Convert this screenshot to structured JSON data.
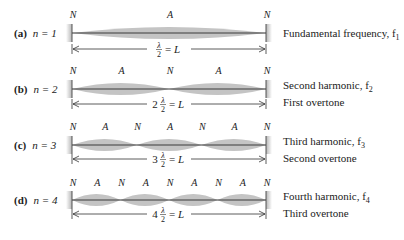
{
  "figure": {
    "colors": {
      "envelope": "#c4c4c4",
      "string": "#3a3a3a",
      "wall": "#bdbdbd",
      "text": "#222222"
    },
    "string_span": {
      "x_left": 72,
      "x_right": 266
    },
    "rows": [
      {
        "id": "a",
        "letter": "(a)",
        "n_label": "n = 1",
        "n": 1,
        "node_labels": [
          "N",
          "A",
          "N"
        ],
        "length_label": "λ/2 = L",
        "length_prefix": "",
        "caption_line1": "Fundamental frequency, f",
        "caption_sub1": "1",
        "caption_line2": ""
      },
      {
        "id": "b",
        "letter": "(b)",
        "n_label": "n = 2",
        "n": 2,
        "node_labels": [
          "N",
          "A",
          "N",
          "A",
          "N"
        ],
        "length_label": "2 λ/2 = L",
        "length_prefix": "2",
        "caption_line1": "Second harmonic, f",
        "caption_sub1": "2",
        "caption_line2": "First overtone"
      },
      {
        "id": "c",
        "letter": "(c)",
        "n_label": "n = 3",
        "n": 3,
        "node_labels": [
          "N",
          "A",
          "N",
          "A",
          "N",
          "A",
          "N"
        ],
        "length_label": "3 λ/2 = L",
        "length_prefix": "3",
        "caption_line1": "Third harmonic, f",
        "caption_sub1": "3",
        "caption_line2": "Second overtone"
      },
      {
        "id": "d",
        "letter": "(d)",
        "n_label": "n = 4",
        "n": 4,
        "node_labels": [
          "N",
          "A",
          "N",
          "A",
          "N",
          "A",
          "N",
          "A",
          "N"
        ],
        "length_label": "4 λ/2 = L",
        "length_prefix": "4",
        "caption_line1": "Fourth harmonic, f",
        "caption_sub1": "4",
        "caption_line2": "Third overtone"
      }
    ],
    "symbols": {
      "lambda": "λ",
      "two": "2",
      "equals_L": "= L",
      "L": "L"
    }
  }
}
